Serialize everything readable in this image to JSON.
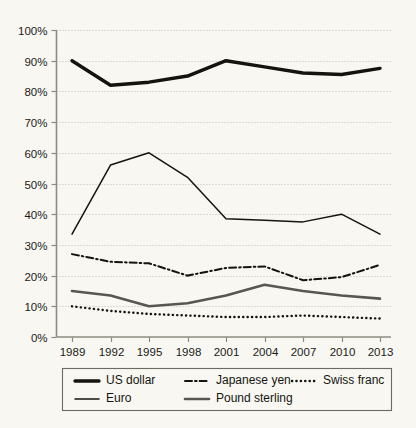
{
  "chart_data": {
    "type": "line",
    "title": "",
    "subtitle": "",
    "xlabel": "",
    "ylabel": "",
    "categories": [
      "1989",
      "1992",
      "1995",
      "1998",
      "2001",
      "2004",
      "2007",
      "2010",
      "2013"
    ],
    "x": [
      1989,
      1992,
      1995,
      1998,
      2001,
      2004,
      2007,
      2010,
      2013
    ],
    "ylim": [
      0,
      100
    ],
    "ytick_values": [
      0,
      10,
      20,
      30,
      40,
      50,
      60,
      70,
      80,
      90,
      100
    ],
    "ytick_labels": [
      "0%",
      "10%",
      "20%",
      "30%",
      "40%",
      "50%",
      "60%",
      "70%",
      "80%",
      "90%",
      "100%"
    ],
    "grid": true,
    "legend_position": "bottom",
    "series": [
      {
        "name": "US dollar",
        "values": [
          90,
          82,
          83,
          85,
          90,
          88,
          86,
          85.5,
          87.5
        ],
        "color": "#14140e",
        "style": "solid-thick"
      },
      {
        "name": "Japanese yen",
        "values": [
          27,
          24.5,
          24,
          20,
          22.5,
          23,
          18.5,
          19.5,
          23.5
        ],
        "color": "#14140e",
        "style": "dash-dot"
      },
      {
        "name": "Swiss franc",
        "values": [
          10,
          8.5,
          7.5,
          7,
          6.5,
          6.5,
          7,
          6.5,
          6
        ],
        "color": "#14140e",
        "style": "dotted"
      },
      {
        "name": "Euro",
        "values": [
          33.5,
          56,
          60,
          52,
          38.5,
          38,
          37.5,
          40,
          33.5
        ],
        "color": "#14140e",
        "style": "solid-thin"
      },
      {
        "name": "Pound sterling",
        "values": [
          15,
          13.5,
          10,
          11,
          13.5,
          17,
          15,
          13.5,
          12.5
        ],
        "color": "#575750",
        "style": "solid-medium"
      }
    ]
  },
  "legend": {
    "entries": [
      {
        "label": "US dollar"
      },
      {
        "label": "Japanese yen"
      },
      {
        "label": "Swiss franc"
      },
      {
        "label": "Euro"
      },
      {
        "label": "Pound sterling"
      }
    ]
  },
  "colors": {
    "background": "#f8f7f2",
    "ink": "#14140e",
    "grey_series": "#575750",
    "grid": "#b9b7ab",
    "axis": "#8e8c80"
  }
}
